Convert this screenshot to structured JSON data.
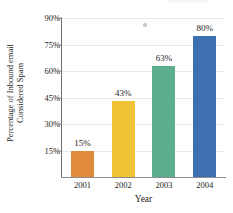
{
  "chart_data": {
    "type": "bar",
    "title": "",
    "xlabel": "Year",
    "ylabel": "Percentage of Inbound email Considered Spam",
    "ylabel_lines": [
      "Percentage of Inbound email",
      "Considered Spam"
    ],
    "categories": [
      "2001",
      "2002",
      "2003",
      "2004"
    ],
    "values": [
      15,
      43,
      63,
      80
    ],
    "value_labels": [
      "15%",
      "43%",
      "63%",
      "80%"
    ],
    "ytick_labels": [
      "15%",
      "30%",
      "45%",
      "60%",
      "75%",
      "90%"
    ],
    "ytick_values": [
      15,
      30,
      45,
      60,
      75,
      90
    ],
    "ylim": [
      0,
      90
    ],
    "grid": true,
    "legend": "none",
    "bar_colors": [
      "#E08B3C",
      "#F0C236",
      "#5BAF8D",
      "#3E6FB0"
    ],
    "axis_color": "#6f6f6f",
    "grid_color": "#e9e9e9"
  }
}
